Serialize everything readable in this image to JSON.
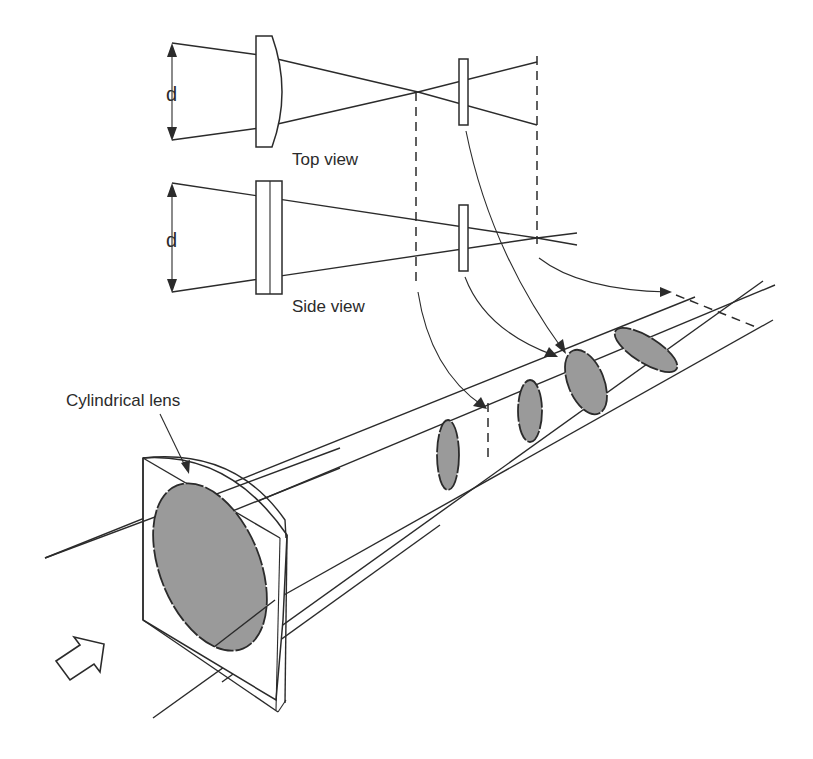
{
  "figure": {
    "type": "optics-diagram",
    "colors": {
      "line": "#2b2b2b",
      "spot_fill": "#9a9a9a",
      "background": "#ffffff"
    }
  },
  "labels": {
    "top_view": "Top view",
    "side_view": "Side view",
    "dimension_top": "d",
    "dimension_side": "d",
    "cylindrical_lens": "Cylindrical lens"
  },
  "top_view": {
    "lens_shape": "plano-convex cylindrical (curved in plane)",
    "focus": "converges to line focus then diverges",
    "elements": [
      "beam width arrow d",
      "curved lens",
      "crossover point",
      "thin plate",
      "dashed reference planes"
    ]
  },
  "side_view": {
    "lens_shape": "flat slab (no curvature in this plane)",
    "focus": "converges further to second focus",
    "elements": [
      "beam width arrow d",
      "flat lens slab",
      "thin plate",
      "dashed reference planes"
    ]
  },
  "perspective_view": {
    "input_arrow": "hollow-arrow-icon",
    "beam_cross_sections": [
      {
        "name": "input-circle",
        "description": "circular spot on lens face"
      },
      {
        "name": "vertical-line-focus",
        "description": "vertical ellipse at first focus"
      },
      {
        "name": "dashed-line-focus-1",
        "description": "dashed vertical line at top-view focus"
      },
      {
        "name": "intermediate-ellipse-1",
        "description": "vertical ellipse"
      },
      {
        "name": "intermediate-ellipse-2",
        "description": "tilted ellipse"
      },
      {
        "name": "horizontal-ellipse",
        "description": "ellipse elongated horizontally"
      },
      {
        "name": "dashed-line-focus-2",
        "description": "dashed horizontal line at side-view focus"
      }
    ]
  }
}
